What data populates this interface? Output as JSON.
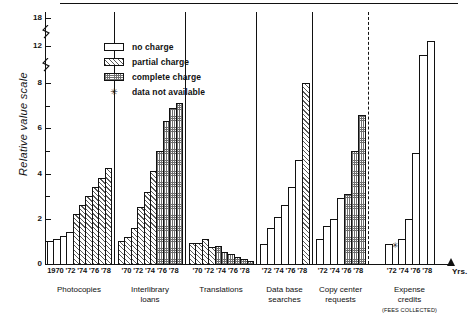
{
  "chart_data": {
    "type": "bar",
    "title": "",
    "xlabel": "Yrs.",
    "ylabel": "Relative value scale",
    "ylim": [
      0,
      18
    ],
    "y_ticks": [
      0,
      1,
      2,
      3,
      4,
      5,
      6,
      7,
      8,
      12,
      18
    ],
    "y_labeled_ticks": [
      "0",
      "2",
      "4",
      "6",
      "8",
      "12",
      "18"
    ],
    "axis_breaks": [
      "between 8 and 12",
      "between 12 and 18"
    ],
    "grid": false,
    "legend_position": "upper-center",
    "legend": [
      {
        "key": "no_charge",
        "label": "no charge",
        "fill": "white"
      },
      {
        "key": "partial_charge",
        "label": "partial charge",
        "fill": "diagonal-hatch"
      },
      {
        "key": "complete_charge",
        "label": "complete charge",
        "fill": "cross-hatch"
      },
      {
        "key": "not_available",
        "label": "data not available",
        "fill": "asterisk"
      }
    ],
    "groups": [
      {
        "name": "Photocopies",
        "tick_label": "1970 '72 '74 '76 '78",
        "years": [
          1970,
          1971,
          1972,
          1973,
          1974,
          1975,
          1976,
          1977,
          1978,
          1979
        ],
        "values": [
          1.0,
          1.1,
          1.25,
          1.4,
          2.2,
          2.6,
          3.0,
          3.4,
          3.8,
          4.25
        ],
        "charges": [
          "no_charge",
          "no_charge",
          "no_charge",
          "no_charge",
          "partial_charge",
          "partial_charge",
          "partial_charge",
          "partial_charge",
          "partial_charge",
          "partial_charge"
        ]
      },
      {
        "name": "Interlibrary loans",
        "tick_label": "'70 '72 '74 '76 '78",
        "years": [
          1970,
          1971,
          1972,
          1973,
          1974,
          1975,
          1976,
          1977,
          1978,
          1979
        ],
        "values": [
          1.0,
          1.2,
          1.6,
          2.5,
          3.2,
          4.1,
          5.0,
          6.3,
          6.9,
          7.1
        ],
        "charges": [
          "partial_charge",
          "partial_charge",
          "partial_charge",
          "partial_charge",
          "partial_charge",
          "partial_charge",
          "complete_charge",
          "complete_charge",
          "complete_charge",
          "complete_charge"
        ],
        "dip_note": "1978 drops to 6.0 between peaks"
      },
      {
        "name": "Translations",
        "tick_label": "'70 '72 '74 '76 '78",
        "years": [
          1970,
          1971,
          1972,
          1973,
          1974,
          1975,
          1976,
          1977,
          1978,
          1979
        ],
        "values": [
          0.95,
          0.95,
          1.1,
          0.75,
          0.8,
          0.55,
          0.45,
          0.3,
          0.2,
          0.12
        ],
        "charges": [
          "partial_charge",
          "partial_charge",
          "partial_charge",
          "partial_charge",
          "complete_charge",
          "complete_charge",
          "complete_charge",
          "complete_charge",
          "complete_charge",
          "complete_charge"
        ]
      },
      {
        "name": "Data base searches",
        "tick_label": "'72 '74 '76 '78",
        "years": [
          1972,
          1973,
          1974,
          1975,
          1976,
          1977,
          1978
        ],
        "values": [
          0.9,
          1.6,
          2.1,
          2.6,
          3.4,
          4.6,
          8.0
        ],
        "charges": [
          "no_charge",
          "no_charge",
          "no_charge",
          "no_charge",
          "no_charge",
          "no_charge",
          "partial_charge"
        ]
      },
      {
        "name": "Copy center requests",
        "tick_label": "'72 '74 '76 '78",
        "years": [
          1972,
          1973,
          1974,
          1975,
          1976,
          1977,
          1978
        ],
        "values": [
          1.1,
          1.7,
          2.0,
          2.9,
          3.1,
          5.0,
          6.6
        ],
        "charges": [
          "no_charge",
          "no_charge",
          "no_charge",
          "no_charge",
          "complete_charge",
          "complete_charge",
          "complete_charge"
        ]
      },
      {
        "name": "Expense credits",
        "subcaption": "(FEES COLLECTED)",
        "tick_label": "'72 '74 '76 '78",
        "years": [
          1972,
          1973,
          1974,
          1975,
          1976,
          1977,
          1978
        ],
        "values": [
          0.9,
          null,
          1.1,
          2.0,
          4.9,
          11.0,
          13.0
        ],
        "charges": [
          "no_charge",
          "not_available",
          "no_charge",
          "no_charge",
          "no_charge",
          "no_charge",
          "no_charge"
        ],
        "note": "asterisk marks 1973 as data not available"
      }
    ]
  },
  "axis": {
    "y_title": "Relative value scale",
    "x_unit": "Yrs.",
    "labels_18": "18",
    "labels_12": "12",
    "labels_8": "8",
    "labels_6": "6",
    "labels_4": "4",
    "labels_2": "2",
    "labels_0": "0"
  },
  "legend": {
    "items": [
      {
        "label": "no charge"
      },
      {
        "label": "partial charge"
      },
      {
        "label": "complete charge"
      },
      {
        "label": "data not available"
      }
    ],
    "asterisk": "✳"
  },
  "groups_meta": [
    {
      "caption": "Photocopies",
      "sub": "",
      "ticks": "1970 '72 '74 '76 '78"
    },
    {
      "caption": "Interlibrary",
      "sub": "loans",
      "ticks": "'70 '72 '74 '76 '78"
    },
    {
      "caption": "Translations",
      "sub": "",
      "ticks": "'70 '72 '74 '76 '78"
    },
    {
      "caption": "Data base",
      "sub": "searches",
      "ticks": "'72 '74 '76 '78"
    },
    {
      "caption": "Copy center",
      "sub": "requests",
      "ticks": "'72 '74 '76 '78"
    },
    {
      "caption": "Expense",
      "sub": "credits",
      "sub2": "(FEES COLLECTED)",
      "ticks": "'72 '74 '76 '78"
    }
  ],
  "colors": {
    "ink": "#111111",
    "hatch": "#5a5a5a",
    "background": "#ffffff"
  }
}
